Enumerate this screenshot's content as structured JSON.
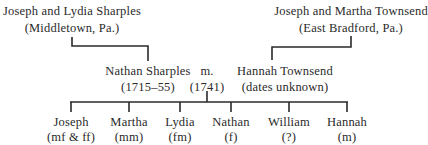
{
  "diagram": {
    "type": "family-tree",
    "parents": {
      "left": {
        "name": "Joseph and Lydia Sharples",
        "place": "(Middletown, Pa.)"
      },
      "right": {
        "name": "Joseph and Martha Townsend",
        "place": "(East Bradford, Pa.)"
      }
    },
    "couple": {
      "husband": {
        "name": "Nathan Sharples",
        "dates": "(1715–55)"
      },
      "marriage": {
        "label": "m.",
        "year": "(1741)"
      },
      "wife": {
        "name": "Hannah Townsend",
        "dates": "(dates unknown)"
      }
    },
    "children": [
      {
        "name": "Joseph",
        "note": "(mf & ff)"
      },
      {
        "name": "Martha",
        "note": "(mm)"
      },
      {
        "name": "Lydia",
        "note": "(fm)"
      },
      {
        "name": "Nathan",
        "note": "(f)"
      },
      {
        "name": "William",
        "note": "(?)"
      },
      {
        "name": "Hannah",
        "note": "(m)"
      }
    ]
  }
}
